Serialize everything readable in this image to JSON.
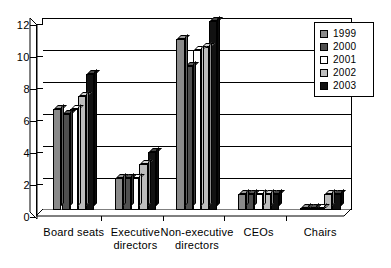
{
  "chart_data": {
    "type": "bar",
    "title": "",
    "xlabel": "",
    "ylabel": "",
    "ylim": [
      0,
      12
    ],
    "yticks": [
      0,
      2,
      4,
      6,
      8,
      10,
      12
    ],
    "grid": true,
    "legend_position": "top-right",
    "categories": [
      "Board seats",
      "Executive directors",
      "Non-executive directors",
      "CEOs",
      "Chairs"
    ],
    "series": [
      {
        "name": "1999",
        "color": "#8a8a8a",
        "values": [
          6.3,
          2.0,
          10.7,
          1.0,
          0.05
        ]
      },
      {
        "name": "2000",
        "color": "#4f4f4f",
        "values": [
          6.0,
          2.0,
          9.0,
          1.0,
          0.05
        ]
      },
      {
        "name": "2001",
        "color": "#ffffff",
        "values": [
          6.3,
          2.0,
          10.0,
          1.0,
          0.05
        ]
      },
      {
        "name": "2002",
        "color": "#bdbdbd",
        "values": [
          7.1,
          2.9,
          10.2,
          1.0,
          1.0
        ]
      },
      {
        "name": "2003",
        "color": "#111111",
        "values": [
          8.5,
          3.6,
          11.8,
          1.0,
          1.0
        ]
      }
    ]
  },
  "legend": {
    "items": [
      {
        "label": "1999"
      },
      {
        "label": "2000"
      },
      {
        "label": "2001"
      },
      {
        "label": "2002"
      },
      {
        "label": "2003"
      }
    ]
  },
  "axis": {
    "y_tick_labels": [
      "0",
      "2",
      "4",
      "6",
      "8",
      "10",
      "12"
    ],
    "x_tick_labels": [
      "Board seats",
      "Executive directors",
      "Non-executive directors",
      "CEOs",
      "Chairs"
    ]
  }
}
